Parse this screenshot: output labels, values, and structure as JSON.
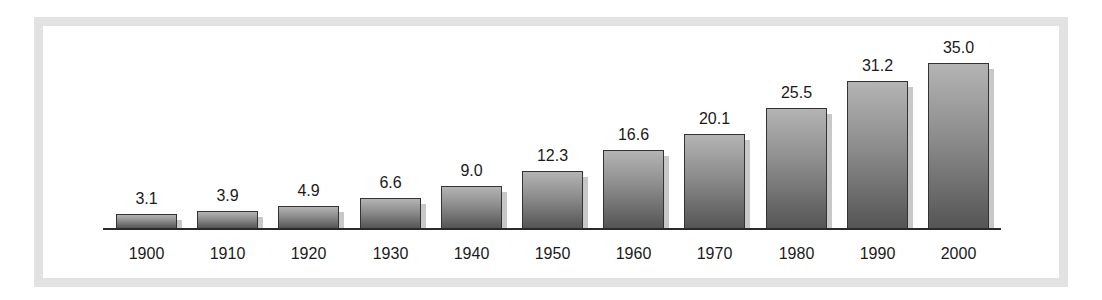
{
  "chart_data": {
    "type": "bar",
    "title": "",
    "xlabel": "",
    "ylabel": "",
    "categories": [
      "1900",
      "1910",
      "1920",
      "1930",
      "1940",
      "1950",
      "1960",
      "1970",
      "1980",
      "1990",
      "2000"
    ],
    "values": [
      3.1,
      3.9,
      4.9,
      6.6,
      9.0,
      12.3,
      16.6,
      20.1,
      25.5,
      31.2,
      35.0
    ],
    "value_labels": [
      "3.1",
      "3.9",
      "4.9",
      "6.6",
      "9.0",
      "12.3",
      "16.6",
      "20.1",
      "25.5",
      "31.2",
      "35.0"
    ],
    "ylim": [
      0,
      35
    ],
    "grid": false,
    "legend": null,
    "bar_color": "#7a7a7a",
    "data_labels": true
  }
}
